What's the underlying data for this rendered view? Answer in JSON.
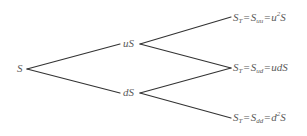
{
  "diagram": {
    "type": "binomial-tree",
    "colors": {
      "line": "#333333",
      "text": "#5a5a5a",
      "background": "#ffffff"
    },
    "nodes": {
      "root": {
        "label": "S"
      },
      "up": {
        "label": "uS"
      },
      "down": {
        "label": "dS"
      },
      "leaf_uu": {
        "lhs": "S",
        "lhs_sub": "T",
        "eq": "=",
        "mid": "S",
        "mid_sub": "uu",
        "eq2": "=",
        "rhs_pre": "u",
        "rhs_sup": "2",
        "rhs_post": "S"
      },
      "leaf_ud": {
        "lhs": "S",
        "lhs_sub": "T",
        "eq": "=",
        "mid": "S",
        "mid_sub": "ud",
        "eq2": "=",
        "rhs": "udS"
      },
      "leaf_dd": {
        "lhs": "S",
        "lhs_sub": "T",
        "eq": "=",
        "mid": "S",
        "mid_sub": "dd",
        "eq2": "=",
        "rhs_pre": "d",
        "rhs_sup": "2",
        "rhs_post": "S"
      }
    },
    "edges": [
      {
        "from": "root",
        "to": "up"
      },
      {
        "from": "root",
        "to": "down"
      },
      {
        "from": "up",
        "to": "leaf_uu"
      },
      {
        "from": "up",
        "to": "leaf_ud"
      },
      {
        "from": "down",
        "to": "leaf_ud"
      },
      {
        "from": "down",
        "to": "leaf_dd"
      }
    ]
  }
}
